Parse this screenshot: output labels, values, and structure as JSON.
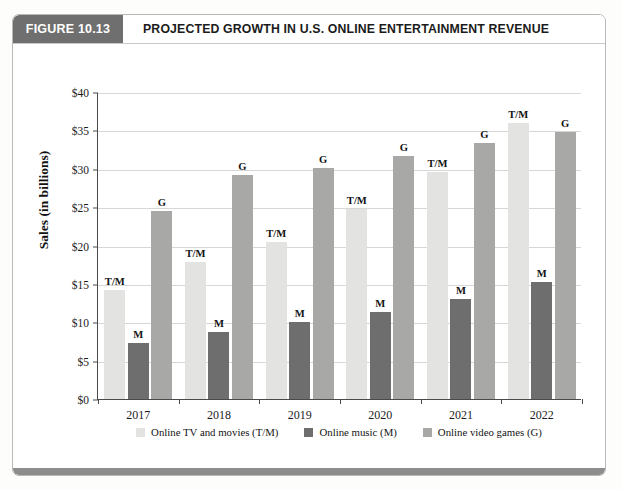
{
  "figure": {
    "tag_label": "FIGURE 10.13",
    "title": "PROJECTED GROWTH IN U.S. ONLINE ENTERTAINMENT REVENUE",
    "tag_bg": "#6f6f6f",
    "bottom_band_color": "#8d8d8d"
  },
  "chart_data": {
    "type": "bar",
    "title": "PROJECTED GROWTH IN U.S. ONLINE ENTERTAINMENT REVENUE",
    "subtitle": "",
    "xlabel": "",
    "ylabel": "Sales (in billions)",
    "ylim": [
      0,
      40
    ],
    "ytick_step": 5,
    "ytick_labels": [
      "$0",
      "$5",
      "$10",
      "$15",
      "$20",
      "$25",
      "$30",
      "$35",
      "$40"
    ],
    "ytick_values": [
      0,
      5,
      10,
      15,
      20,
      25,
      30,
      35,
      40
    ],
    "grid": true,
    "grid_axis": "y",
    "legend_position": "bottom",
    "categories": [
      "2017",
      "2018",
      "2019",
      "2020",
      "2021",
      "2022"
    ],
    "series": [
      {
        "name": "Online TV and movies (T/M)",
        "short": "T/M",
        "color": "#e3e3e1",
        "values": [
          14.2,
          17.8,
          20.5,
          24.8,
          29.6,
          36.0
        ]
      },
      {
        "name": "Online music (M)",
        "short": "M",
        "color": "#6e6e6e",
        "values": [
          7.3,
          8.7,
          10.0,
          11.3,
          13.0,
          15.2
        ]
      },
      {
        "name": "Online video games (G)",
        "short": "G",
        "color": "#a8a8a6",
        "values": [
          24.5,
          29.2,
          30.1,
          31.6,
          33.3,
          34.8
        ]
      }
    ]
  }
}
